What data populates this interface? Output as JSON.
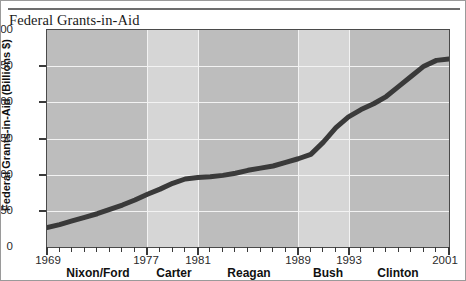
{
  "title": "Federal Grants-in-Aid",
  "chart_data": {
    "type": "line",
    "title": "Federal Grants-in-Aid",
    "xlabel": "",
    "ylabel": "Federal Grants-in-Aid (Billions $)",
    "ylim": [
      0,
      300
    ],
    "xlim": [
      1969,
      2001
    ],
    "yticks": [
      300,
      250,
      200,
      150,
      100,
      50,
      0
    ],
    "ytick_labels": [
      "300",
      "250",
      "200",
      "150",
      "100",
      "50",
      "0"
    ],
    "xticks": [
      1969,
      1977,
      1981,
      1989,
      1993,
      2001
    ],
    "xtick_labels": [
      "1969",
      "1977",
      "1981",
      "1989",
      "1993",
      "2001"
    ],
    "grid": true,
    "legend": "none",
    "line_color": "#3a3a3a",
    "line_width": 5,
    "band_color_dark": "#bdbdbd",
    "band_color_light": "#d6d6d6",
    "gridline_color": "#f3f3f3",
    "administrations": [
      {
        "name": "Nixon/Ford",
        "start": 1969,
        "end": 1977,
        "shade": "dark"
      },
      {
        "name": "Carter",
        "start": 1977,
        "end": 1981,
        "shade": "light"
      },
      {
        "name": "Reagan",
        "start": 1981,
        "end": 1989,
        "shade": "dark"
      },
      {
        "name": "Bush",
        "start": 1989,
        "end": 1993,
        "shade": "light"
      },
      {
        "name": "Clinton",
        "start": 1993,
        "end": 2001,
        "shade": "dark"
      }
    ],
    "x": [
      1969,
      1970,
      1971,
      1972,
      1973,
      1974,
      1975,
      1976,
      1977,
      1978,
      1979,
      1980,
      1981,
      1982,
      1983,
      1984,
      1985,
      1986,
      1987,
      1988,
      1989,
      1990,
      1991,
      1992,
      1993,
      1994,
      1995,
      1996,
      1997,
      1998,
      1999,
      2000,
      2001
    ],
    "values": [
      27,
      31,
      36,
      41,
      46,
      52,
      58,
      65,
      73,
      80,
      88,
      94,
      96,
      97,
      99,
      102,
      106,
      109,
      112,
      117,
      122,
      128,
      145,
      165,
      180,
      190,
      198,
      208,
      222,
      236,
      250,
      258,
      260
    ],
    "annotations": []
  },
  "axis": {
    "y_label": "Federal Grants-in-Aid (Billions $)"
  }
}
